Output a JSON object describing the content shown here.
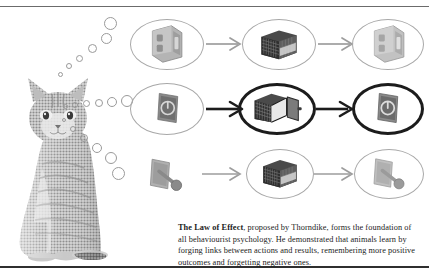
{
  "figure": {
    "title_bold": "The Law of Effect",
    "caption_rest": ", proposed by Thorndike, forms the foundation of all behaviourist psychology. He demonstrated that animals learn by forging links between actions and results, remembering more positive outcomes and forgetting negative ones.",
    "subject": {
      "name": "cat",
      "alt": "seated tabby cat rendered in halftone dots"
    },
    "thought_bubbles": {
      "streams": 3,
      "description": "three diverging chains of open circles rising from the cat's head, growing larger toward each diagram row",
      "stream_top": [
        4,
        5,
        7,
        9,
        11,
        13
      ],
      "stream_middle": [
        5,
        6,
        7,
        8,
        10,
        12
      ],
      "stream_bottom": [
        4,
        6,
        8,
        10,
        12,
        13
      ]
    },
    "rows": [
      {
        "id": "row-forgotten",
        "emphasis": "faded",
        "meaning": "negative outcome, forgotten",
        "steps": [
          {
            "icon": "switch-plate-icon",
            "label": "switch plate",
            "enclosed": true,
            "bold": false
          },
          {
            "icon": "closed-cage-icon",
            "label": "closed puzzle box",
            "enclosed": true,
            "bold": false
          },
          {
            "icon": "switch-plate-icon",
            "label": "switch plate",
            "enclosed": true,
            "bold": false
          }
        ]
      },
      {
        "id": "row-remembered",
        "emphasis": "bold",
        "meaning": "positive outcome, remembered",
        "steps": [
          {
            "icon": "power-button-icon",
            "label": "power button panel",
            "enclosed": true,
            "bold": false
          },
          {
            "icon": "open-cage-icon",
            "label": "open puzzle box",
            "enclosed": true,
            "bold": true
          },
          {
            "icon": "power-button-icon",
            "label": "power button panel",
            "enclosed": true,
            "bold": true
          }
        ]
      },
      {
        "id": "row-lever",
        "emphasis": "faded",
        "meaning": "negative outcome, forgotten",
        "steps": [
          {
            "icon": "lever-switch-icon",
            "label": "lever switch",
            "enclosed": false,
            "bold": false
          },
          {
            "icon": "closed-cage-icon",
            "label": "closed puzzle box",
            "enclosed": true,
            "bold": false
          },
          {
            "icon": "lever-switch-icon",
            "label": "lever switch",
            "enclosed": true,
            "bold": false
          }
        ]
      }
    ],
    "arrows": [
      {
        "row": 0,
        "style": "thin-gray"
      },
      {
        "row": 0,
        "style": "thin-gray"
      },
      {
        "row": 1,
        "style": "bold-black"
      },
      {
        "row": 1,
        "style": "bold-black"
      },
      {
        "row": 2,
        "style": "thin-gray"
      },
      {
        "row": 2,
        "style": "thin-gray"
      }
    ],
    "colors": {
      "ink": "#1b1b1b",
      "faded": "#a8a8a8",
      "bold": "#1c1c1c",
      "background": "#ffffff",
      "rule_top": "#6b6b6b",
      "rule_bottom": "#2f2f2f"
    }
  }
}
